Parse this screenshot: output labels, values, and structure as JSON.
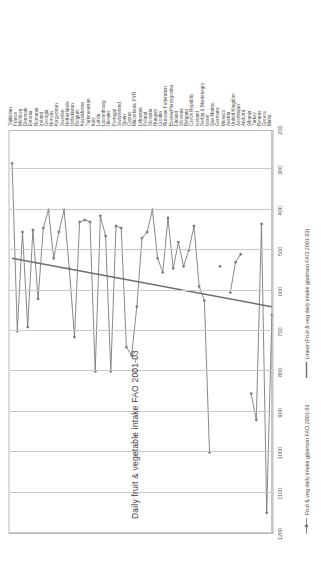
{
  "chart_data": {
    "type": "line",
    "title": "Daily fruit  & vegetable intake FAO  2001-03",
    "xlabel": "",
    "ylabel": "",
    "orientation": "rotated-90",
    "grid": true,
    "legend_position": "bottom",
    "value_axis": {
      "min": 200,
      "max": 1200,
      "step": 100,
      "ticks": [
        1200,
        1100,
        1000,
        900,
        800,
        700,
        600,
        500,
        400,
        300,
        200
      ]
    },
    "categories": [
      "Tajikistan",
      "France",
      "Moldova",
      "Denmark",
      "Estonia",
      "Romania",
      "Ireland",
      "Georgia",
      "Norway",
      "Kyrgyzstan",
      "Sweden",
      "Netherlands",
      "Uzbekistan",
      "Belgium",
      "Kazakhstan",
      "Turkmenistan",
      "Italy",
      "Latvia",
      "Luxembourg",
      "Ukraine",
      "Portugal",
      "Switzerland",
      "Spain",
      "Cyprus",
      "Macedonia, FYR",
      "Lithuania",
      "Poland",
      "Slovakia",
      "Hungary",
      "Croatia",
      "Russian Federation",
      "Bosnia/Herzegovina",
      "Finland",
      "Slovenia",
      "Bulgaria",
      "Czech Republic",
      "Iceland",
      "Serbia & Montenegro",
      "Israel",
      "San Marino",
      "Germany",
      "Monaco",
      "Austria",
      "United Kingdom",
      "Azerbaijan",
      "Andorra",
      "Albania",
      "Turkey",
      "Belarus",
      "Greece",
      "Malta"
    ],
    "series": [
      {
        "name": "Fruit & veg daily intake g/person FAO 2001-03",
        "marker": "diamond",
        "color": "#7b7b7b",
        "values": [
          285,
          700,
          455,
          690,
          450,
          620,
          445,
          400,
          520,
          455,
          400,
          545,
          715,
          430,
          425,
          430,
          800,
          415,
          465,
          800,
          440,
          445,
          740,
          760,
          640,
          470,
          455,
          400,
          520,
          555,
          420,
          545,
          480,
          540,
          500,
          440,
          590,
          625,
          1000,
          null,
          540,
          null,
          605,
          530,
          510,
          null,
          855,
          920,
          435,
          1150,
          660
        ]
      },
      {
        "name": "Linear (Fruit & veg daily intake g/person FAO 2001-03)",
        "type": "trendline",
        "color": "#6e6e6e",
        "start_value": 520,
        "end_value": 640
      }
    ]
  },
  "legend": {
    "items": [
      {
        "label": "Fruit & veg daily intake g/person FAO 2001-03",
        "kind": "marker-line"
      },
      {
        "label": "Linear (Fruit & veg daily intake g/person FAO 2001-03)",
        "kind": "line"
      }
    ]
  }
}
